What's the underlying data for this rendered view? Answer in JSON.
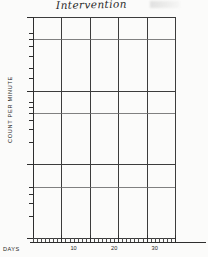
{
  "chart_data": {
    "type": "line",
    "title": "Intervention",
    "xlabel": "DAYS",
    "ylabel": "COUNT PER MINUTE",
    "scale": "log",
    "grid": true,
    "legend_position": "none",
    "ylim": [
      0.1,
      100
    ],
    "xlim": [
      0,
      35
    ],
    "y_tick_labels": [
      "100",
      "60",
      "50",
      "40",
      "30",
      "20",
      "15",
      "10",
      "7",
      "6",
      "5",
      "4",
      "3",
      "2",
      "1",
      ".5",
      ".4",
      ".3",
      ".2",
      ".1",
      "0"
    ],
    "x_tick_labels": [
      "10",
      "20",
      "30"
    ],
    "x_gridlines": [
      7,
      14,
      21,
      28,
      35
    ],
    "phase_change_day": 4,
    "annotations": [
      {
        "text": "Intervention",
        "position": "top-left",
        "style": "handwritten"
      }
    ],
    "series": [
      {
        "name": "Baseline",
        "connected": true,
        "x": [
          2,
          3,
          4
        ],
        "values": [
          10,
          16,
          11
        ]
      },
      {
        "name": "Intervention",
        "connected": false,
        "x": [
          5,
          6,
          7,
          9,
          10,
          11,
          12,
          13,
          14
        ],
        "values": [
          11,
          11,
          12,
          13,
          15,
          17,
          19,
          21,
          19
        ]
      }
    ]
  },
  "colors": {
    "ink": "#111111",
    "grid": "#3c3c3c",
    "paper": "#fbfbfa"
  }
}
